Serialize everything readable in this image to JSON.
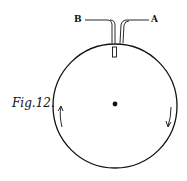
{
  "figure": {
    "caption": "Fig.12.",
    "label_left": "B",
    "label_right": "A",
    "colors": {
      "ink": "#111111",
      "background": "#ffffff"
    }
  }
}
